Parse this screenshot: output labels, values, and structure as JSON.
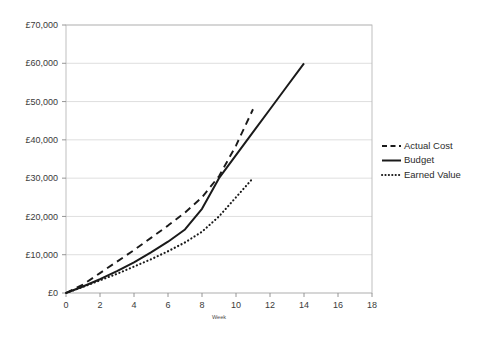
{
  "chart_data": {
    "type": "line",
    "title": "",
    "xlabel": "Week",
    "ylabel": "",
    "xlim": [
      0,
      18
    ],
    "ylim": [
      0,
      70000
    ],
    "grid": true,
    "legend_position": "right",
    "x_ticks": [
      0,
      2,
      4,
      6,
      8,
      10,
      12,
      14,
      16,
      18
    ],
    "x_tick_labels": [
      "0",
      "2",
      "4",
      "6",
      "8",
      "10",
      "12",
      "14",
      "16",
      "18"
    ],
    "y_ticks": [
      0,
      10000,
      20000,
      30000,
      40000,
      50000,
      60000,
      70000
    ],
    "y_tick_labels": [
      "£0",
      "£10,000",
      "£20,000",
      "£30,000",
      "£40,000",
      "£50,000",
      "£60,000",
      "£70,000"
    ],
    "currency_symbol": "£",
    "series": [
      {
        "name": "Actual Cost",
        "style": "dashed",
        "color": "#1a1a1a",
        "x": [
          0,
          1,
          2,
          3,
          4,
          5,
          6,
          7,
          8,
          9,
          10,
          11
        ],
        "values": [
          0,
          2200,
          5200,
          8200,
          11200,
          14400,
          17600,
          21000,
          25000,
          30500,
          38500,
          48000
        ]
      },
      {
        "name": "Budget",
        "style": "solid",
        "color": "#1a1a1a",
        "x": [
          0,
          1,
          2,
          3,
          4,
          5,
          6,
          7,
          8,
          9,
          10,
          11,
          12,
          13,
          14
        ],
        "values": [
          0,
          1700,
          3600,
          5700,
          8000,
          10600,
          13400,
          16600,
          22000,
          30000,
          36000,
          42000,
          48000,
          54000,
          60000
        ]
      },
      {
        "name": "Earned Value",
        "style": "dotted",
        "color": "#1a1a1a",
        "x": [
          0,
          1,
          2,
          3,
          4,
          5,
          6,
          7,
          8,
          9,
          10,
          11
        ],
        "values": [
          0,
          1600,
          3300,
          5000,
          6900,
          8800,
          10900,
          13200,
          16000,
          20000,
          25000,
          30000
        ]
      }
    ]
  },
  "legend": {
    "items": [
      {
        "label": "Actual Cost",
        "style": "dashed"
      },
      {
        "label": "Budget",
        "style": "solid"
      },
      {
        "label": "Earned Value",
        "style": "dotted"
      }
    ]
  },
  "axis": {
    "x_title": "Week"
  }
}
